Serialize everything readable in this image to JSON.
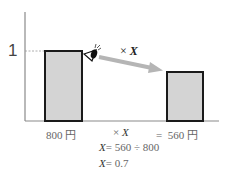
{
  "diagram": {
    "y_tick_label": "1",
    "arrow_label": {
      "times": "×",
      "var": "X"
    },
    "bars": [
      {
        "label_value": "800",
        "label_unit": "円",
        "relative_height": 1.0
      },
      {
        "label_value": "560",
        "label_unit": "円",
        "relative_height": 0.7
      }
    ],
    "equation_row": {
      "times": "×",
      "var": "X",
      "equals": "="
    },
    "steps": [
      {
        "var": "X",
        "rhs": "= 560 ÷ 800"
      },
      {
        "var": "X",
        "rhs": "= 0.7"
      }
    ],
    "colors": {
      "bar_fill": "#d4d4d4",
      "bar_stroke": "#1a1a1a",
      "axis": "#777777",
      "arrow": "#b5b5b5"
    },
    "icons": [
      "eye-icon",
      "arrow-icon"
    ]
  }
}
